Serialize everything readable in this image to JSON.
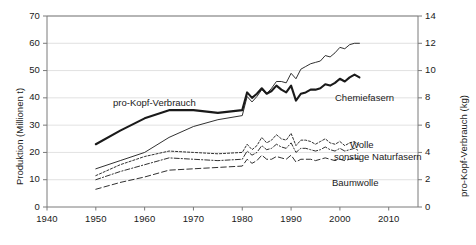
{
  "chart_data": {
    "type": "line",
    "title": "",
    "xlabel": "",
    "ylabel": "Produktion (Millionen t)",
    "y2label": "pro-Kopf-Verbrauch (kg)",
    "xlim": [
      1940,
      2016
    ],
    "ylim": [
      0,
      70
    ],
    "y2lim": [
      0,
      14
    ],
    "grid": true,
    "legend_position": "inline-annotations",
    "x_ticks": [
      1940,
      1950,
      1960,
      1970,
      1980,
      1990,
      2000,
      2010
    ],
    "y_ticks_left": [
      0,
      10,
      20,
      30,
      40,
      50,
      60,
      70
    ],
    "y_ticks_right": [
      0,
      2,
      4,
      6,
      8,
      10,
      12,
      14
    ],
    "series": [
      {
        "name": "pro-Kopf-Verbrauch",
        "axis": "right",
        "style": "solid-thick",
        "x": [
          1950,
          1955,
          1960,
          1965,
          1970,
          1975,
          1980,
          1981,
          1982,
          1983,
          1984,
          1985,
          1986,
          1987,
          1988,
          1989,
          1990,
          1991,
          1992,
          1993,
          1994,
          1995,
          1996,
          1997,
          1998,
          1999,
          2000,
          2001,
          2002,
          2003,
          2004
        ],
        "values": [
          4.6,
          5.6,
          6.5,
          7.1,
          7.1,
          6.9,
          7.1,
          8.4,
          8.0,
          8.3,
          8.7,
          8.3,
          8.5,
          8.9,
          8.6,
          8.4,
          8.9,
          7.8,
          8.3,
          8.4,
          8.6,
          8.6,
          8.7,
          9.0,
          8.9,
          9.1,
          9.4,
          9.2,
          9.5,
          9.7,
          9.5
        ]
      },
      {
        "name": "Chemiefasern",
        "axis": "left",
        "style": "solid-thin",
        "x": [
          1950,
          1955,
          1960,
          1965,
          1970,
          1975,
          1980,
          1981,
          1982,
          1983,
          1984,
          1985,
          1986,
          1987,
          1988,
          1989,
          1990,
          1991,
          1992,
          1993,
          1994,
          1995,
          1996,
          1997,
          1998,
          1999,
          2000,
          2001,
          2002,
          2003,
          2004
        ],
        "values": [
          14.0,
          17.0,
          20.0,
          25.5,
          29.5,
          32.0,
          33.5,
          40.5,
          38.5,
          40.5,
          43.0,
          41.5,
          43.5,
          46.0,
          46.0,
          45.5,
          49.0,
          47.0,
          50.5,
          51.5,
          52.5,
          53.0,
          53.5,
          55.5,
          55.0,
          56.5,
          58.5,
          58.0,
          59.5,
          60.0,
          60.0
        ]
      },
      {
        "name": "Wolle",
        "axis": "left",
        "style": "dotted",
        "x": [
          1950,
          1955,
          1960,
          1965,
          1970,
          1975,
          1980,
          1981,
          1982,
          1983,
          1984,
          1985,
          1986,
          1987,
          1988,
          1989,
          1990,
          1991,
          1992,
          1993,
          1994,
          1995,
          1996,
          1997,
          1998,
          1999,
          2000,
          2001,
          2002,
          2003,
          2004
        ],
        "values": [
          11.5,
          15.5,
          18.5,
          20.5,
          20.0,
          19.5,
          20.0,
          23.0,
          21.0,
          22.5,
          25.5,
          23.5,
          24.5,
          26.5,
          25.0,
          24.5,
          27.0,
          22.5,
          24.5,
          24.5,
          24.0,
          23.0,
          24.0,
          25.0,
          23.5,
          23.0,
          24.0,
          22.5,
          23.5,
          24.0,
          22.5
        ]
      },
      {
        "name": "sonstige Naturfasern",
        "axis": "left",
        "style": "dash-dot",
        "x": [
          1950,
          1955,
          1960,
          1965,
          1970,
          1975,
          1980,
          1981,
          1982,
          1983,
          1984,
          1985,
          1986,
          1987,
          1988,
          1989,
          1990,
          1991,
          1992,
          1993,
          1994,
          1995,
          1996,
          1997,
          1998,
          1999,
          2000,
          2001,
          2002,
          2003,
          2004
        ],
        "values": [
          10.0,
          13.0,
          15.5,
          18.0,
          17.5,
          17.0,
          17.5,
          20.5,
          19.0,
          20.0,
          22.5,
          21.0,
          21.5,
          23.0,
          22.0,
          21.5,
          23.5,
          20.0,
          21.5,
          21.5,
          21.0,
          20.5,
          21.0,
          22.0,
          21.0,
          20.5,
          21.5,
          20.5,
          21.0,
          21.5,
          20.5
        ]
      },
      {
        "name": "Baumwolle",
        "axis": "left",
        "style": "dashed",
        "x": [
          1950,
          1955,
          1960,
          1965,
          1970,
          1975,
          1980,
          1981,
          1982,
          1983,
          1984,
          1985,
          1986,
          1987,
          1988,
          1989,
          1990,
          1991,
          1992,
          1993,
          1994,
          1995,
          1996,
          1997,
          1998,
          1999,
          2000,
          2001,
          2002,
          2003,
          2004
        ],
        "values": [
          6.5,
          9.0,
          11.0,
          13.5,
          14.0,
          14.5,
          15.0,
          17.5,
          16.0,
          17.0,
          19.0,
          17.5,
          17.5,
          18.5,
          18.0,
          17.5,
          19.0,
          16.5,
          17.5,
          17.5,
          17.5,
          17.0,
          17.5,
          18.0,
          17.5,
          17.0,
          17.5,
          17.0,
          17.5,
          18.0,
          17.5
        ]
      }
    ],
    "annotations": [
      {
        "text": "pro-Kopf-Verbrauch",
        "x_px": 113,
        "y_px": 97
      },
      {
        "text": "Chemiefasern",
        "x_px": 335,
        "y_px": 92
      },
      {
        "text": "Wolle",
        "x_px": 350,
        "y_px": 139
      },
      {
        "text": "sonstige Naturfasern",
        "x_px": 334,
        "y_px": 151
      },
      {
        "text": "Baumwolle",
        "x_px": 332,
        "y_px": 177
      }
    ]
  },
  "axes": {
    "left_title": "Produktion (Millionen t)",
    "right_title": "pro-Kopf-Verbrauch (kg)",
    "x_ticks": [
      "1940",
      "1950",
      "1960",
      "1970",
      "1980",
      "1990",
      "2000",
      "2010"
    ],
    "y_ticks_left": [
      "70",
      "60",
      "50",
      "40",
      "30",
      "20",
      "10",
      "0"
    ],
    "y_ticks_right": [
      "14",
      "12",
      "10",
      "8",
      "6",
      "4",
      "2",
      "0"
    ]
  },
  "colors": {
    "line": "#1a1a1a",
    "grid": "#d9d9d9",
    "axis": "#7a7a7a",
    "background": "#ffffff"
  }
}
